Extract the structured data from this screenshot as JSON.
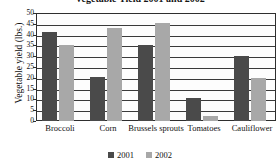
{
  "chart_data": {
    "type": "bar",
    "title": "Vegetable Yield 2001 and 2002",
    "xlabel": "",
    "ylabel": "Vegetable yield (lbs.)",
    "categories": [
      "Broccoli",
      "Corn",
      "Brussels sprouts",
      "Tomatoes",
      "Cauliflower"
    ],
    "series": [
      {
        "name": "2001",
        "color": "#4a4a4a",
        "values": [
          41,
          20.5,
          35,
          10.5,
          30
        ]
      },
      {
        "name": "2002",
        "color": "#a8a8a8",
        "values": [
          35,
          43,
          45.5,
          2.5,
          20
        ]
      }
    ],
    "ylim": [
      0,
      50
    ],
    "yticks": [
      "50",
      "45",
      "40",
      "35",
      "30",
      "25",
      "20",
      "15",
      "10",
      "5",
      "0"
    ],
    "ytick_values": [
      50,
      45,
      40,
      35,
      30,
      25,
      20,
      15,
      10,
      5,
      0
    ],
    "grid": true,
    "legend_position": "bottom"
  },
  "legend": {
    "items": [
      {
        "label": "2001",
        "color": "#4a4a4a"
      },
      {
        "label": "2002",
        "color": "#a8a8a8"
      }
    ]
  }
}
